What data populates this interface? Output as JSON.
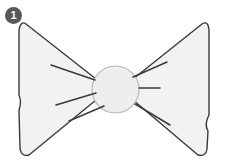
{
  "figure": {
    "step_badge": {
      "label": "1",
      "background_color": "#58585a",
      "text_color": "#ffffff"
    },
    "canvas": {
      "width": 228,
      "height": 168,
      "background_color": "#ffffff"
    },
    "style": {
      "outline_color": "#3a3a3a",
      "outline_width": 1.4,
      "fill_color": "#f2f2f2",
      "knot_fill_color": "#eeeeee",
      "crease_color": "#3a3a3a",
      "crease_width": 1.5
    },
    "parts": [
      {
        "name": "left-wing",
        "description": "Left triangular bow wing with rounded corners and concave inner waist",
        "path": "M 26 24 Q 21 20 19 30 L 19 95 Q 22 102 19 110 L 20 148 Q 21 157 29 155 L 96 100 Q 104 90 96 79 Z"
      },
      {
        "name": "right-wing",
        "description": "Right triangular bow wing with rounded corners and concave inner waist",
        "path": "M 202 24 Q 208 20 209 30 L 209 115 Q 204 124 208 131 L 207 149 Q 206 157 198 155 L 133 100 Q 126 90 133 79 Z"
      },
      {
        "name": "center-knot",
        "description": "Round central knot of the bow",
        "circle": {
          "cx": 115.5,
          "cy": 89.5,
          "r": 23.5
        }
      }
    ],
    "creases": [
      {
        "name": "crease-left-upper",
        "x1": 51,
        "y1": 65,
        "x2": 95,
        "y2": 80
      },
      {
        "name": "crease-left-middle",
        "x1": 56,
        "y1": 105,
        "x2": 96,
        "y2": 93
      },
      {
        "name": "crease-left-lower",
        "x1": 69,
        "y1": 121,
        "x2": 104,
        "y2": 106
      },
      {
        "name": "crease-right-upper",
        "x1": 167,
        "y1": 62,
        "x2": 133,
        "y2": 77
      },
      {
        "name": "crease-right-middle",
        "x1": 160,
        "y1": 88,
        "x2": 139,
        "y2": 88
      },
      {
        "name": "crease-right-lower",
        "x1": 170,
        "y1": 125,
        "x2": 135,
        "y2": 104
      }
    ]
  }
}
